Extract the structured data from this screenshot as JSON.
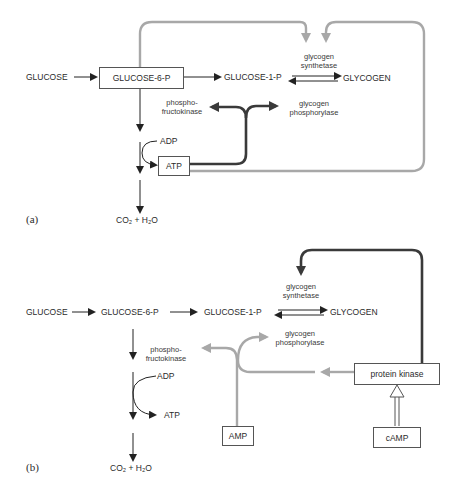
{
  "panel_a": {
    "label": "(a)",
    "glucose": "GLUCOSE",
    "glucose6p": "GLUCOSE-6-P",
    "glucose1p": "GLUCOSE-1-P",
    "glycogen": "GLYCOGEN",
    "synthetase_line1": "glycogen",
    "synthetase_line2": "synthetase",
    "phosphorylase_line1": "glycogen",
    "phosphorylase_line2": "phosphorylase",
    "pfk_line1": "phospho-",
    "pfk_line2": "fructokinase",
    "adp": "ADP",
    "atp": "ATP",
    "products": "CO₂ + H₂O"
  },
  "panel_b": {
    "label": "(b)",
    "glucose": "GLUCOSE",
    "glucose6p": "GLUCOSE-6-P",
    "glucose1p": "GLUCOSE-1-P",
    "glycogen": "GLYCOGEN",
    "synthetase_line1": "glycogen",
    "synthetase_line2": "synthetase",
    "phosphorylase_line1": "glycogen",
    "phosphorylase_line2": "phosphorylase",
    "pfk_line1": "phospho-",
    "pfk_line2": "fructokinase",
    "adp": "ADP",
    "atp": "ATP",
    "products": "CO₂ + H₂O",
    "protein_kinase": "protein kinase",
    "amp": "AMP",
    "camp": "cAMP"
  },
  "colors": {
    "dark_arrow": "#3a3a3a",
    "gray_arrow": "#a8a8a8",
    "text": "#2b2b2b"
  }
}
